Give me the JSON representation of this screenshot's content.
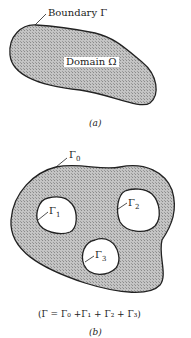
{
  "figure_a": {
    "boundary_label": "Boundary Γ",
    "domain_label": "Domain Ω",
    "caption": "(a)"
  },
  "figure_b": {
    "outer_label": "Γ",
    "outer_sub": "0",
    "holes": [
      {
        "label": "Γ",
        "sub": "1"
      },
      {
        "label": "Γ",
        "sub": "2"
      },
      {
        "label": "Γ",
        "sub": "3"
      }
    ],
    "equation": "(Γ = Γ₀ +Γ₁ + Γ₂ + Γ₃)",
    "caption": "(b)"
  },
  "colors": {
    "fill": "#b8b8b8",
    "stroke": "#222222"
  }
}
